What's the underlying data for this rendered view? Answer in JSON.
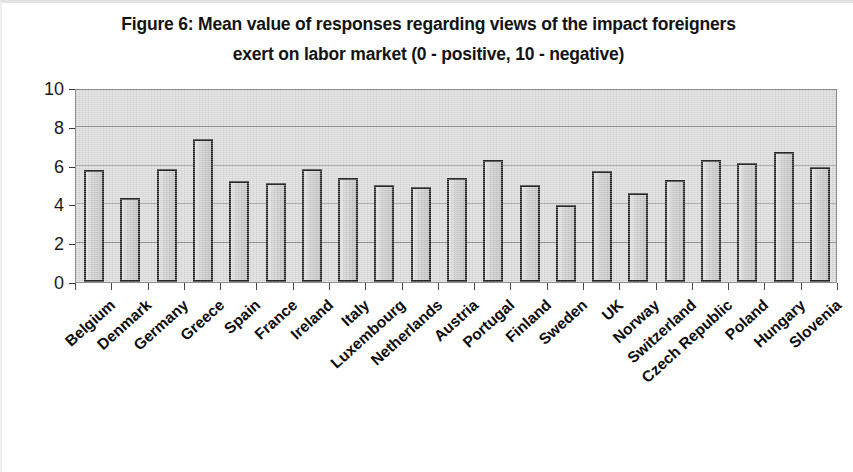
{
  "figure": {
    "title_line1": "Figure 6: Mean value of responses regarding views of  the  impact foreigners",
    "title_line2": "exert on labor market (0 - positive, 10 - negative)"
  },
  "colors": {
    "plot_background": "#d9d9d9",
    "bar_fill": "#c9c9c9",
    "bar_outline": "#202020",
    "gridline": "#8e8e8e",
    "text": "#0d0d0d"
  },
  "chart_data": {
    "type": "bar",
    "title": "Figure 6: Mean value of responses regarding views of  the  impact foreigners exert on labor market (0 - positive, 10 - negative)",
    "xlabel": "",
    "ylabel": "",
    "ylim": [
      0,
      10
    ],
    "yticks": [
      0,
      2,
      4,
      6,
      8,
      10
    ],
    "ytick_labels": [
      "0",
      "2",
      "4",
      "6",
      "8",
      "10"
    ],
    "grid": true,
    "legend": false,
    "categories": [
      "Belgium",
      "Denmark",
      "Germany",
      "Greece",
      "Spain",
      "France",
      "Ireland",
      "Italy",
      "Luxembourg",
      "Netherlands",
      "Austria",
      "Portugal",
      "Finland",
      "Sweden",
      "UK",
      "Norway",
      "Switzerland",
      "Czech Republic",
      "Poland",
      "Hungary",
      "Slovenia"
    ],
    "values": [
      5.75,
      4.35,
      5.85,
      7.35,
      5.2,
      5.1,
      5.85,
      5.35,
      5.0,
      4.9,
      5.35,
      6.3,
      5.0,
      3.95,
      5.7,
      4.6,
      5.25,
      6.3,
      6.15,
      6.7,
      5.95
    ]
  }
}
